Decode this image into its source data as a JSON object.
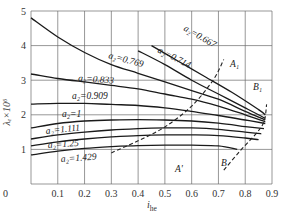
{
  "chart_data": {
    "type": "line",
    "title": "",
    "xlabel": "i_he",
    "ylabel": "λ_e ×10^6",
    "xlim": [
      0,
      0.9
    ],
    "ylim": [
      0,
      5
    ],
    "grid": true,
    "x_ticks": [
      "0",
      "0.1",
      "0.2",
      "0.3",
      "0.4",
      "0.5",
      "0.6",
      "0.7",
      "0.8",
      "0.9"
    ],
    "y_ticks": [
      "1",
      "2",
      "3",
      "4",
      "5"
    ],
    "series": [
      {
        "name": "a2=0.667",
        "label": "a₂=0.667",
        "x": [
          0.45,
          0.55,
          0.65,
          0.75,
          0.85,
          0.875
        ],
        "y": [
          4.0,
          3.55,
          3.1,
          2.65,
          2.15,
          2.0
        ]
      },
      {
        "name": "a2=0.714",
        "label": "a₂=0.714",
        "x": [
          0.4,
          0.5,
          0.6,
          0.7,
          0.8,
          0.875
        ],
        "y": [
          3.85,
          3.45,
          3.0,
          2.6,
          2.2,
          1.9
        ]
      },
      {
        "name": "a2=0.769",
        "label": "a₂=0.769",
        "x": [
          0,
          0.1,
          0.2,
          0.3,
          0.4,
          0.5,
          0.6,
          0.7,
          0.8,
          0.875
        ],
        "y": [
          4.8,
          4.25,
          3.8,
          3.45,
          3.2,
          2.95,
          2.7,
          2.45,
          2.1,
          1.85
        ]
      },
      {
        "name": "a2=0.833",
        "label": "a₂=0.833",
        "x": [
          0,
          0.1,
          0.2,
          0.3,
          0.4,
          0.5,
          0.6,
          0.7,
          0.8,
          0.875
        ],
        "y": [
          3.18,
          3.05,
          2.95,
          2.85,
          2.75,
          2.6,
          2.45,
          2.25,
          2.0,
          1.8
        ]
      },
      {
        "name": "a2=0.909",
        "label": "a₂=0.909",
        "x": [
          0,
          0.1,
          0.2,
          0.3,
          0.4,
          0.5,
          0.6,
          0.7,
          0.8,
          0.875
        ],
        "y": [
          2.31,
          2.33,
          2.33,
          2.3,
          2.27,
          2.2,
          2.1,
          1.98,
          1.85,
          1.75
        ]
      },
      {
        "name": "a2=1",
        "label": "a₂=1",
        "x": [
          0,
          0.1,
          0.2,
          0.3,
          0.4,
          0.5,
          0.6,
          0.7,
          0.8,
          0.87
        ],
        "y": [
          1.62,
          1.75,
          1.82,
          1.85,
          1.86,
          1.85,
          1.82,
          1.76,
          1.66,
          1.6
        ]
      },
      {
        "name": "a2=1.111",
        "label": "a₂=1.111",
        "x": [
          0,
          0.1,
          0.2,
          0.3,
          0.4,
          0.5,
          0.6,
          0.7,
          0.8,
          0.86
        ],
        "y": [
          1.3,
          1.42,
          1.5,
          1.56,
          1.6,
          1.62,
          1.62,
          1.58,
          1.5,
          1.45
        ]
      },
      {
        "name": "a2=1.25",
        "label": "a₂=1.25",
        "x": [
          0,
          0.1,
          0.2,
          0.3,
          0.4,
          0.5,
          0.6,
          0.7,
          0.8,
          0.85
        ],
        "y": [
          1.1,
          1.22,
          1.3,
          1.36,
          1.4,
          1.42,
          1.42,
          1.4,
          1.33,
          1.28
        ]
      },
      {
        "name": "a2=1.429",
        "label": "a₂=1.429",
        "x": [
          0,
          0.1,
          0.2,
          0.3,
          0.4,
          0.5,
          0.6,
          0.7,
          0.77
        ],
        "y": [
          0.84,
          0.95,
          1.03,
          1.08,
          1.11,
          1.12,
          1.12,
          1.1,
          1.0
        ]
      }
    ],
    "boundaries": [
      {
        "name": "A'-A1",
        "style": "dashed",
        "x": [
          0.3,
          0.4,
          0.5,
          0.6,
          0.68,
          0.72
        ],
        "y": [
          0.9,
          1.25,
          1.65,
          2.25,
          3.0,
          3.6
        ]
      },
      {
        "name": "B-B1",
        "style": "dashed",
        "x": [
          0.72,
          0.78,
          0.84,
          0.87,
          0.88
        ],
        "y": [
          0.4,
          0.95,
          1.45,
          1.8,
          2.3
        ]
      }
    ],
    "annotations": [
      "A'",
      "A₁",
      "B",
      "B₁"
    ]
  },
  "labels": {
    "y_axis": "λₑ×10⁶",
    "x_axis_main": "i",
    "x_axis_sub": "he",
    "point_A_prime": "A'",
    "point_A1": "A₁",
    "point_B": "B",
    "point_B1": "B₁"
  }
}
